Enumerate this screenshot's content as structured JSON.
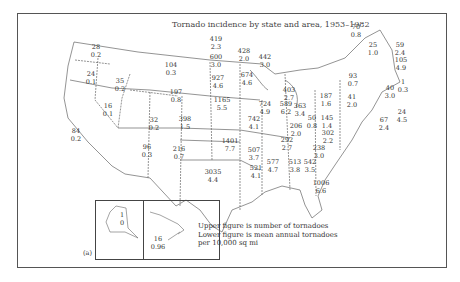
{
  "title": "Tornado incidence by state and area, 1953–1982",
  "panel_label": "(a)",
  "legend": {
    "line1": "Upper figure is number of tornadoes",
    "line2": "Lower figure is mean annual tornadoes",
    "line3": "per 10,000 sq mi"
  },
  "states": [
    {
      "id": "WA",
      "count": "28",
      "rate": "0.2"
    },
    {
      "id": "OR",
      "count": "24",
      "rate": "0.1"
    },
    {
      "id": "CA",
      "count": "84",
      "rate": "0.2"
    },
    {
      "id": "ID",
      "count": "35",
      "rate": "0.2"
    },
    {
      "id": "NV",
      "count": "16",
      "rate": "0.1"
    },
    {
      "id": "MT",
      "count": "104",
      "rate": "0.3"
    },
    {
      "id": "WY",
      "count": "197",
      "rate": "0.8"
    },
    {
      "id": "UT",
      "count": "32",
      "rate": "0.2"
    },
    {
      "id": "AZ",
      "count": "96",
      "rate": "0.3"
    },
    {
      "id": "CO",
      "count": "398",
      "rate": "1.5"
    },
    {
      "id": "NM",
      "count": "216",
      "rate": "0.7"
    },
    {
      "id": "ND",
      "count": "419",
      "rate": "2.3"
    },
    {
      "id": "SD",
      "count": "600",
      "rate": "3.0"
    },
    {
      "id": "NE",
      "count": "927",
      "rate": "4.6"
    },
    {
      "id": "KS",
      "count": "1165",
      "rate": "5.5"
    },
    {
      "id": "OK",
      "count": "1401",
      "rate": "7.7"
    },
    {
      "id": "TX",
      "count": "3035",
      "rate": "4.4"
    },
    {
      "id": "MN",
      "count": "428",
      "rate": "2.0"
    },
    {
      "id": "IA",
      "count": "674",
      "rate": "4.6"
    },
    {
      "id": "MO",
      "count": "742",
      "rate": "4.1"
    },
    {
      "id": "AR",
      "count": "507",
      "rate": "3.7"
    },
    {
      "id": "LA",
      "count": "521",
      "rate": "4.1"
    },
    {
      "id": "WI",
      "count": "442",
      "rate": "3.0"
    },
    {
      "id": "IL",
      "count": "724",
      "rate": "4.9"
    },
    {
      "id": "MI",
      "count": "403",
      "rate": "2.7"
    },
    {
      "id": "IN",
      "count": "589",
      "rate": "6.2"
    },
    {
      "id": "OH",
      "count": "363",
      "rate": "3.4"
    },
    {
      "id": "KY",
      "count": "206",
      "rate": "2.0"
    },
    {
      "id": "TN",
      "count": "292",
      "rate": "2.7"
    },
    {
      "id": "MS",
      "count": "577",
      "rate": "4.7"
    },
    {
      "id": "AL",
      "count": "513",
      "rate": "3.8"
    },
    {
      "id": "GA",
      "count": "542",
      "rate": "3.5"
    },
    {
      "id": "FL",
      "count": "1006",
      "rate": "6.6"
    },
    {
      "id": "SC",
      "count": "238",
      "rate": "3.0"
    },
    {
      "id": "NC",
      "count": "302",
      "rate": "2.2"
    },
    {
      "id": "VA",
      "count": "145",
      "rate": "1.4"
    },
    {
      "id": "WV",
      "count": "50",
      "rate": "0.8"
    },
    {
      "id": "PA",
      "count": "187",
      "rate": "1.6"
    },
    {
      "id": "NY",
      "count": "93",
      "rate": "0.7"
    },
    {
      "id": "VT",
      "count": "25",
      "rate": "1.0"
    },
    {
      "id": "ME",
      "count": "70",
      "rate": "0.8"
    },
    {
      "id": "NH",
      "count": "59",
      "rate": "2.4"
    },
    {
      "id": "MA",
      "count": "105",
      "rate": "4.9"
    },
    {
      "id": "RI",
      "count": "1",
      "rate": "0.3"
    },
    {
      "id": "CT",
      "count": "40",
      "rate": "3.0"
    },
    {
      "id": "NJ",
      "count": "41",
      "rate": "2.0"
    },
    {
      "id": "DE",
      "count": "24",
      "rate": "4.5"
    },
    {
      "id": "MD",
      "count": "67",
      "rate": "2.4"
    },
    {
      "id": "AK",
      "count": "1",
      "rate": "0"
    },
    {
      "id": "HI",
      "count": "16",
      "rate": "0.96"
    }
  ]
}
